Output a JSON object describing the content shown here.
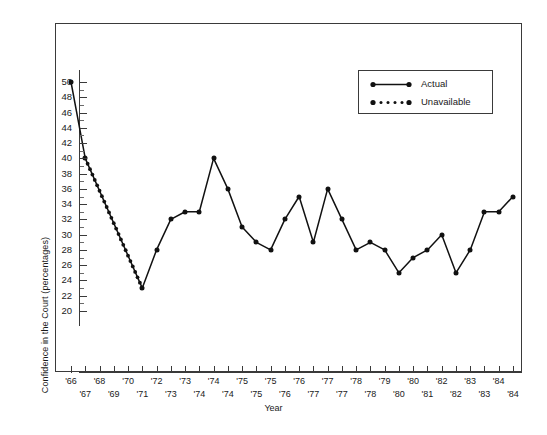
{
  "chart": {
    "type": "line",
    "ylabel": "Confidence in the Court (percentages)",
    "xlabel": "Year",
    "ylim": [
      20,
      50
    ],
    "ystep": 2,
    "grid": false,
    "legend_position": "top-right"
  },
  "axes": {
    "y_ticks": [
      "50",
      "48",
      "46",
      "44",
      "42",
      "40",
      "38",
      "36",
      "34",
      "32",
      "30",
      "28",
      "26",
      "24",
      "22",
      "20"
    ],
    "x_ticks_upper": [
      "'66",
      "'68",
      "'70",
      "'72",
      "'73",
      "'74",
      "'75",
      "'75",
      "'76",
      "'77",
      "'78",
      "'79",
      "'80",
      "'82",
      "'83",
      "'84"
    ],
    "x_ticks_lower": [
      "'67",
      "'69",
      "'71",
      "'73",
      "'74",
      "'74",
      "'75",
      "'76",
      "'77",
      "'77",
      "'78",
      "'80",
      "'81",
      "'82",
      "'83",
      "'84"
    ]
  },
  "legend": {
    "items": [
      {
        "label": "Actual",
        "style": "solid",
        "color": "#111111"
      },
      {
        "label": "Unavailable",
        "style": "dotted",
        "color": "#111111"
      }
    ]
  },
  "chart_data": {
    "type": "line",
    "title": "",
    "xlabel": "Year",
    "ylabel": "Confidence in the Court (percentages)",
    "ylim": [
      20,
      50
    ],
    "xlim": [
      0,
      31
    ],
    "grid": false,
    "legend_position": "top-right",
    "categories": [
      "'66",
      "'67",
      "'68",
      "'69",
      "'70",
      "'71",
      "'72",
      "'73",
      "'73",
      "'74",
      "'74",
      "'74",
      "'75",
      "'75",
      "'75",
      "'76",
      "'76",
      "'77",
      "'77",
      "'77",
      "'78",
      "'78",
      "'79",
      "'80",
      "'80",
      "'81",
      "'82",
      "'82",
      "'83",
      "'83",
      "'84",
      "'84"
    ],
    "series": [
      {
        "name": "Actual",
        "style": "solid",
        "color": "#111111",
        "points": [
          {
            "x": 0,
            "label": "'66",
            "y": 50
          },
          {
            "x": 1,
            "label": "'67",
            "y": 40
          },
          {
            "x": 5,
            "label": "'71",
            "y": 23
          },
          {
            "x": 6,
            "label": "'72",
            "y": 28
          },
          {
            "x": 7,
            "label": "'73",
            "y": 32
          },
          {
            "x": 8,
            "label": "'73",
            "y": 33
          },
          {
            "x": 9,
            "label": "'74",
            "y": 33
          },
          {
            "x": 10,
            "label": "'74",
            "y": 40
          },
          {
            "x": 11,
            "label": "'74",
            "y": 36
          },
          {
            "x": 12,
            "label": "'75",
            "y": 31
          },
          {
            "x": 13,
            "label": "'75",
            "y": 29
          },
          {
            "x": 14,
            "label": "'75",
            "y": 28
          },
          {
            "x": 15,
            "label": "'76",
            "y": 32
          },
          {
            "x": 16,
            "label": "'76",
            "y": 35
          },
          {
            "x": 17,
            "label": "'77",
            "y": 29
          },
          {
            "x": 18,
            "label": "'77",
            "y": 36
          },
          {
            "x": 19,
            "label": "'77",
            "y": 32
          },
          {
            "x": 20,
            "label": "'78",
            "y": 28
          },
          {
            "x": 21,
            "label": "'78",
            "y": 29
          },
          {
            "x": 22,
            "label": "'79",
            "y": 28
          },
          {
            "x": 23,
            "label": "'80",
            "y": 25
          },
          {
            "x": 24,
            "label": "'80",
            "y": 27
          },
          {
            "x": 25,
            "label": "'81",
            "y": 28
          },
          {
            "x": 26,
            "label": "'82",
            "y": 30
          },
          {
            "x": 27,
            "label": "'82",
            "y": 25
          },
          {
            "x": 28,
            "label": "'83",
            "y": 28
          },
          {
            "x": 29,
            "label": "'83",
            "y": 33
          },
          {
            "x": 30,
            "label": "'84",
            "y": 33
          },
          {
            "x": 31,
            "label": "'84",
            "y": 35
          }
        ]
      },
      {
        "name": "Unavailable",
        "style": "dotted",
        "color": "#111111",
        "points": [
          {
            "x": 1,
            "label": "'67",
            "y": 40
          },
          {
            "x": 5,
            "label": "'71",
            "y": 23
          }
        ]
      }
    ]
  }
}
